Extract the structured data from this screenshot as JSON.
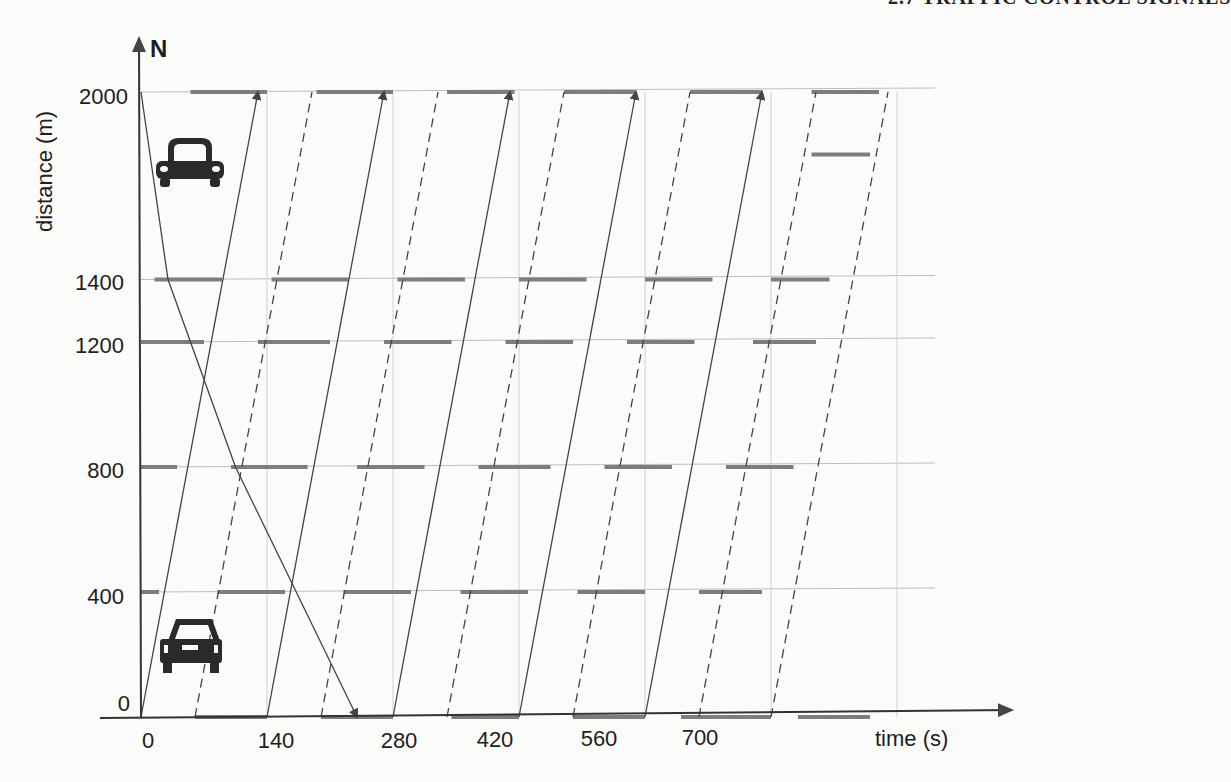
{
  "header": {
    "running_title": "2.7 TRAFFIC CONTROL SIGNALS"
  },
  "figure": {
    "north_label": "N",
    "y_axis_label": "distance (m)",
    "x_axis_label": "time (s)",
    "y_ticks": [
      "0",
      "400",
      "800",
      "1200",
      "1400",
      "2000"
    ],
    "x_ticks": [
      "0",
      "140",
      "280",
      "420",
      "560",
      "700"
    ],
    "icons": [
      "car-northbound-icon",
      "car-southbound-icon"
    ]
  },
  "chart_data": {
    "type": "time-space diagram",
    "title": "",
    "xlabel": "time (s)",
    "ylabel": "distance (m)",
    "xlim": [
      0,
      840
    ],
    "ylim": [
      0,
      2000
    ],
    "grid": true,
    "x_ticks": [
      0,
      140,
      280,
      420,
      560,
      700
    ],
    "y_ticks": [
      0,
      400,
      800,
      1200,
      1400,
      2000
    ],
    "intersections_m": [
      0,
      400,
      800,
      1200,
      1400,
      2000
    ],
    "cycle_length_s": 140,
    "red_intervals_s": {
      "0": [
        [
          60,
          140
        ],
        [
          200,
          280
        ],
        [
          345,
          420
        ],
        [
          480,
          560
        ],
        [
          600,
          700
        ],
        [
          730,
          810
        ]
      ],
      "400": [
        [
          0,
          20
        ],
        [
          85,
          160
        ],
        [
          225,
          300
        ],
        [
          355,
          430
        ],
        [
          485,
          560
        ],
        [
          620,
          690
        ]
      ],
      "800": [
        [
          0,
          40
        ],
        [
          100,
          185
        ],
        [
          240,
          315
        ],
        [
          375,
          455
        ],
        [
          515,
          590
        ],
        [
          650,
          725
        ]
      ],
      "1200": [
        [
          0,
          70
        ],
        [
          130,
          210
        ],
        [
          270,
          345
        ],
        [
          405,
          480
        ],
        [
          540,
          615
        ],
        [
          680,
          750
        ]
      ],
      "1400": [
        [
          15,
          90
        ],
        [
          145,
          230
        ],
        [
          285,
          360
        ],
        [
          420,
          495
        ],
        [
          560,
          635
        ],
        [
          700,
          765
        ]
      ],
      "2000": [
        [
          55,
          140
        ],
        [
          195,
          280
        ],
        [
          340,
          415
        ],
        [
          470,
          550
        ],
        [
          610,
          690
        ],
        [
          745,
          820
        ]
      ],
      "1800": [
        [
          745,
          810
        ]
      ]
    },
    "northbound_trajectories_s": [
      {
        "t0": 0,
        "t1": 140
      },
      {
        "t0": 140,
        "t1": 280
      },
      {
        "t0": 280,
        "t1": 420
      },
      {
        "t0": 420,
        "t1": 560
      },
      {
        "t0": 560,
        "t1": 700
      }
    ],
    "southbound_trajectory": {
      "t0": 0,
      "t1": 240,
      "from_m": 2000,
      "to_m": 0
    },
    "line_styles": {
      "northbound_band_start": "solid",
      "band_end": "dashed",
      "red_phase": "thick gray"
    }
  }
}
